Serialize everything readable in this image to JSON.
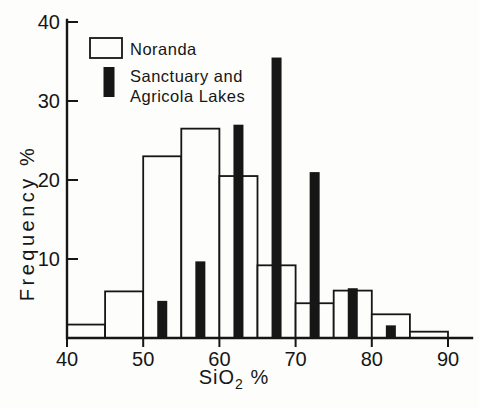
{
  "figure": {
    "background_color": "#fdfdfb",
    "ink_color": "#161616"
  },
  "legend": {
    "items": [
      {
        "label": "Noranda",
        "swatch": "open-rectangle"
      },
      {
        "label_line1": "Sanctuary and",
        "label_line2": "Agricola Lakes",
        "swatch": "solid-bar"
      }
    ]
  },
  "chart_data": {
    "type": "bar",
    "subtype": "overlaid-histogram",
    "title": "",
    "ylabel": "Frequency %",
    "xlabel_parts": {
      "main": "SiO",
      "sub": "2",
      "suffix": " %"
    },
    "xlim": [
      40,
      92.5
    ],
    "ylim": [
      0,
      40
    ],
    "x_ticks": [
      40,
      50,
      60,
      70,
      80,
      90
    ],
    "y_ticks": [
      10,
      20,
      30,
      40
    ],
    "grid": false,
    "legend_position": "upper left inside plot",
    "series": [
      {
        "name": "Noranda",
        "style": "open outlined histogram",
        "bin_width": 5,
        "bin_starts": [
          40,
          45,
          50,
          55,
          60,
          65,
          70,
          75,
          80,
          85
        ],
        "values": [
          1.7,
          5.9,
          23,
          26.5,
          20.5,
          9.2,
          4.4,
          6,
          3,
          0.8
        ]
      },
      {
        "name": "Sanctuary and Agricola Lakes",
        "style": "solid narrow bars at bin midpoints",
        "bar_centers": [
          52.5,
          57.5,
          62.5,
          67.5,
          72.5,
          77.5,
          82.5
        ],
        "values": [
          4.7,
          9.7,
          27,
          35.5,
          21,
          6.3,
          1.6
        ]
      }
    ]
  }
}
